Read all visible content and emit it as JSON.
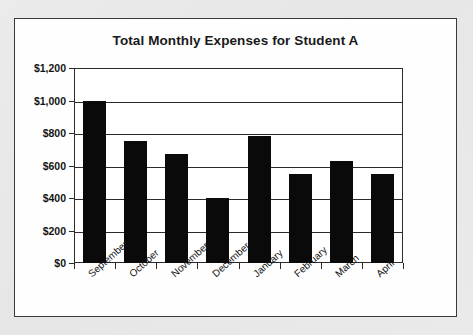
{
  "chart_data": {
    "type": "bar",
    "title": "Total Monthly Expenses for Student A",
    "xlabel": "",
    "ylabel": "",
    "categories": [
      "September",
      "October",
      "November",
      "December",
      "January",
      "February",
      "March",
      "April"
    ],
    "values": [
      1000,
      750,
      670,
      400,
      780,
      545,
      630,
      550
    ],
    "ylim": [
      0,
      1200
    ],
    "ytick_values": [
      0,
      200,
      400,
      600,
      800,
      1000,
      1200
    ],
    "ytick_labels": [
      "$0",
      "$200",
      "$400",
      "$600",
      "$800",
      "$1,000",
      "$1,200"
    ],
    "grid": true,
    "legend": "none",
    "bar_color": "#0a0a0a",
    "series": [
      {
        "name": "Total Monthly Expenses",
        "values": [
          1000,
          750,
          670,
          400,
          780,
          545,
          630,
          550
        ]
      }
    ]
  },
  "style": {
    "page_background": "#e9e9e9",
    "panel_background": "#fefefe",
    "panel_border": "#3a3a3a",
    "axis_color": "#2b2b2b",
    "text_color": "#141414"
  }
}
